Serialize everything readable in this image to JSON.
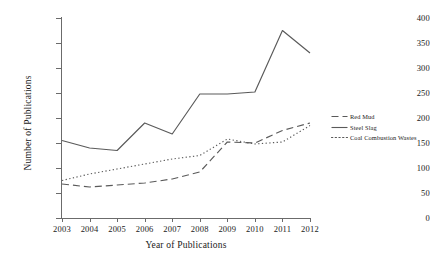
{
  "chart_data": {
    "type": "line",
    "title": "",
    "xlabel": "Year of Publications",
    "ylabel": "Number of Publications",
    "categories": [
      "2003",
      "2004",
      "2005",
      "2006",
      "2007",
      "2008",
      "2009",
      "2010",
      "2011",
      "2012"
    ],
    "x": [
      2003,
      2004,
      2005,
      2006,
      2007,
      2008,
      2009,
      2010,
      2011,
      2012
    ],
    "xlim": [
      2003,
      2012
    ],
    "ylim": [
      0,
      400
    ],
    "yticks": [
      0,
      50,
      100,
      150,
      200,
      250,
      300,
      350,
      400
    ],
    "grid": false,
    "legend_position": "right",
    "series": [
      {
        "name": "Red Mud",
        "style": "dashed",
        "color": "#5a5a5a",
        "values": [
          68,
          62,
          66,
          70,
          78,
          92,
          152,
          150,
          175,
          190
        ]
      },
      {
        "name": "Steel Slag",
        "style": "solid",
        "color": "#5a5a5a",
        "values": [
          155,
          140,
          135,
          190,
          168,
          248,
          248,
          252,
          375,
          330
        ]
      },
      {
        "name": "Coal Combustion Wastes",
        "style": "dotted",
        "color": "#5a5a5a",
        "values": [
          75,
          88,
          98,
          108,
          118,
          125,
          158,
          148,
          152,
          185
        ]
      }
    ]
  },
  "legend": {
    "items": [
      {
        "label": "Red Mud",
        "style": "dashed"
      },
      {
        "label": "Steel Slag",
        "style": "solid"
      },
      {
        "label": "Coal Combustion Wastes",
        "style": "dotted"
      }
    ]
  }
}
